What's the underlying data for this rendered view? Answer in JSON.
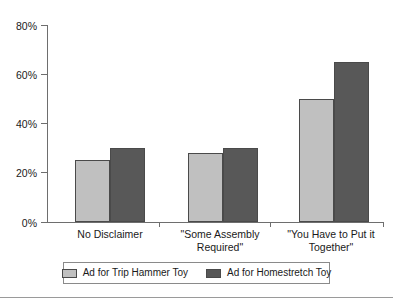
{
  "chart_data": {
    "type": "bar",
    "title": "",
    "xlabel": "",
    "ylabel": "",
    "ylim": [
      0,
      80
    ],
    "grid": false,
    "legend_position": "bottom",
    "categories": [
      "No Disclaimer",
      "\"Some Assembly Required\"",
      "\"You Have to Put it Together\""
    ],
    "category_lines": [
      [
        "No Disclaimer"
      ],
      [
        "\"Some Assembly",
        "Required\""
      ],
      [
        "\"You Have to Put it",
        "Together\""
      ]
    ],
    "y_ticks": [
      "0%",
      "20%",
      "40%",
      "60%",
      "80%"
    ],
    "y_tick_values": [
      0,
      20,
      40,
      60,
      80
    ],
    "series": [
      {
        "name": "Ad for Trip Hammer Toy",
        "color": "#c0c0c0",
        "values": [
          25,
          28,
          50
        ]
      },
      {
        "name": "Ad for Homestretch Toy",
        "color": "#585858",
        "values": [
          30,
          30,
          65
        ]
      }
    ]
  },
  "colors": {
    "series_a": "#c0c0c0",
    "series_b": "#585858",
    "bar_border": "#4a4a4a",
    "axis": "#6e6e6e",
    "text": "#1a1a1a",
    "legend_border": "#8a8a8a",
    "footer_rule": "#9a9a9a"
  }
}
